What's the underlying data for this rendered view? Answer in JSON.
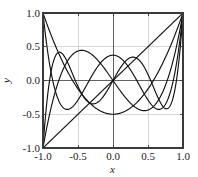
{
  "chart_data": {
    "type": "line",
    "title": "",
    "subtitle": "",
    "xlabel": "x",
    "ylabel": "y",
    "xlim": [
      -1.0,
      1.0
    ],
    "ylim": [
      -1.0,
      1.0
    ],
    "grid": true,
    "legend": "none",
    "xticks": [
      "-1.0",
      "-0.5",
      "0.0",
      "0.5",
      "1.0"
    ],
    "xtick_values": [
      -1.0,
      -0.5,
      0.0,
      0.5,
      1.0
    ],
    "yticks": [
      "-1.0",
      "-0.5",
      "0.0",
      "0.5",
      "1.0"
    ],
    "ytick_values": [
      -1.0,
      -0.5,
      0.0,
      0.5,
      1.0
    ],
    "series": [
      {
        "name": "P1",
        "expression": "x",
        "color": "#111111",
        "x": [
          -1.0,
          -0.9,
          -0.8,
          -0.7,
          -0.6,
          -0.5,
          -0.4,
          -0.3,
          -0.2,
          -0.1,
          0.0,
          0.1,
          0.2,
          0.3,
          0.4,
          0.5,
          0.6,
          0.7,
          0.8,
          0.9,
          1.0
        ],
        "values": [
          -1.0,
          -0.9,
          -0.8,
          -0.7,
          -0.6,
          -0.5,
          -0.4,
          -0.3,
          -0.2,
          -0.1,
          0.0,
          0.1,
          0.2,
          0.3,
          0.4,
          0.5,
          0.6,
          0.7,
          0.8,
          0.9,
          1.0
        ]
      },
      {
        "name": "P2",
        "expression": "(3x^2 - 1)/2",
        "color": "#111111",
        "x": [
          -1.0,
          -0.9,
          -0.8,
          -0.7,
          -0.6,
          -0.5,
          -0.4,
          -0.3,
          -0.2,
          -0.1,
          0.0,
          0.1,
          0.2,
          0.3,
          0.4,
          0.5,
          0.6,
          0.7,
          0.8,
          0.9,
          1.0
        ],
        "values": [
          1.0,
          0.715,
          0.46,
          0.235,
          0.04,
          -0.125,
          -0.26,
          -0.365,
          -0.44,
          -0.485,
          -0.5,
          -0.485,
          -0.44,
          -0.365,
          -0.26,
          -0.125,
          0.04,
          0.235,
          0.46,
          0.715,
          1.0
        ]
      },
      {
        "name": "P3",
        "expression": "(5x^3 - 3x)/2",
        "color": "#111111",
        "x": [
          -1.0,
          -0.9,
          -0.8,
          -0.7,
          -0.6,
          -0.5,
          -0.4,
          -0.3,
          -0.2,
          -0.1,
          0.0,
          0.1,
          0.2,
          0.3,
          0.4,
          0.5,
          0.6,
          0.7,
          0.8,
          0.9,
          1.0
        ],
        "values": [
          -1.0,
          -0.4725,
          -0.08,
          0.1925,
          0.36,
          0.4375,
          0.44,
          0.3825,
          0.28,
          0.1475,
          0.0,
          -0.1475,
          -0.28,
          -0.3825,
          -0.44,
          -0.4375,
          -0.36,
          -0.1925,
          0.08,
          0.4725,
          1.0
        ]
      },
      {
        "name": "P4",
        "expression": "(35x^4 - 30x^2 + 3)/8",
        "color": "#111111",
        "x": [
          -1.0,
          -0.9,
          -0.8,
          -0.7,
          -0.6,
          -0.5,
          -0.4,
          -0.3,
          -0.2,
          -0.1,
          0.0,
          0.1,
          0.2,
          0.3,
          0.4,
          0.5,
          0.6,
          0.7,
          0.8,
          0.9,
          1.0
        ],
        "values": [
          1.0,
          0.2079,
          -0.233,
          -0.4121,
          -0.408,
          -0.2891,
          -0.113,
          0.0729,
          0.232,
          0.3379,
          0.375,
          0.3379,
          0.232,
          0.0729,
          -0.113,
          -0.2891,
          -0.408,
          -0.4121,
          -0.233,
          0.2079,
          1.0
        ]
      },
      {
        "name": "P5",
        "expression": "(63x^5 - 70x^3 + 15x)/8",
        "color": "#111111",
        "x": [
          -1.0,
          -0.9,
          -0.8,
          -0.7,
          -0.6,
          -0.5,
          -0.4,
          -0.3,
          -0.2,
          -0.1,
          0.0,
          0.1,
          0.2,
          0.3,
          0.4,
          0.5,
          0.6,
          0.7,
          0.8,
          0.9,
          1.0
        ],
        "values": [
          -1.0,
          0.0411,
          0.3995,
          0.3652,
          0.1526,
          -0.0898,
          -0.2706,
          -0.3652,
          -0.3749,
          -0.3167,
          -0.2126,
          -0.0898,
          0.0342,
          0.1445,
          0.2706,
          0.3652,
          0.3995,
          0.3283,
          0.1526,
          -0.0411,
          1.0
        ]
      }
    ]
  },
  "axes": {
    "frame_color": "#3a3a3a",
    "grid_color": "#c8c8c8",
    "zero_line_color": "#555555",
    "curve_color": "#111111"
  }
}
